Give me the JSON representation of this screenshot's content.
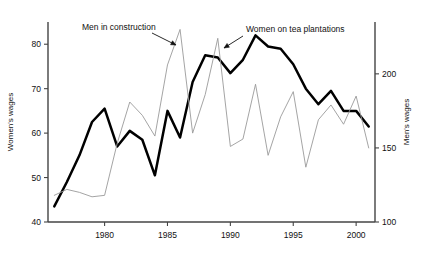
{
  "chart_data": {
    "type": "line",
    "title": "",
    "xlabel": "",
    "ylabel": "Women's wages",
    "y2label": "Men's wages",
    "xlim": [
      1975.5,
      2001.5
    ],
    "ylim": [
      40,
      85
    ],
    "y2lim": [
      100,
      235
    ],
    "grid": false,
    "legend": "none (inline annotations with arrows)",
    "x_ticks": [
      "1980",
      "1985",
      "1990",
      "1995",
      "2000"
    ],
    "x_tick_values": [
      1980,
      1985,
      1990,
      1995,
      2000
    ],
    "y_ticks": [
      "40",
      "50",
      "60",
      "70",
      "80"
    ],
    "y_tick_values": [
      40,
      50,
      60,
      70,
      80
    ],
    "y2_ticks": [
      "100",
      "150",
      "200"
    ],
    "y2_tick_values": [
      100,
      150,
      200
    ],
    "annotations": [
      {
        "text": "Men in construction",
        "points_to_series": "Men in construction",
        "points_to_year": 1986
      },
      {
        "text": "Women on tea plantations",
        "points_to_series": "Women on tea plantations",
        "points_to_year": 1992
      }
    ],
    "x": [
      1976,
      1977,
      1978,
      1979,
      1980,
      1981,
      1982,
      1983,
      1984,
      1985,
      1986,
      1987,
      1988,
      1989,
      1990,
      1991,
      1992,
      1993,
      1994,
      1995,
      1996,
      1997,
      1998,
      1999,
      2000,
      2001
    ],
    "series": [
      {
        "name": "Women on tea plantations",
        "axis": "left",
        "style": "thick black line",
        "color": "#000000",
        "values": [
          43.5,
          49.0,
          55.0,
          62.5,
          65.5,
          57.0,
          60.5,
          58.5,
          50.5,
          65.0,
          59.0,
          71.5,
          77.5,
          77.0,
          73.5,
          76.5,
          82.0,
          79.5,
          79.0,
          75.5,
          70.0,
          66.5,
          69.5,
          65.0,
          65.0,
          61.5
        ]
      },
      {
        "name": "Men in construction",
        "axis": "right",
        "style": "thin grey line",
        "color": "#9a9a9a",
        "values": [
          118,
          122,
          120,
          117,
          118,
          153,
          181,
          172,
          158,
          206,
          230,
          160,
          186,
          224,
          151,
          156,
          193,
          145,
          171,
          188,
          137,
          169,
          179,
          166,
          185,
          150
        ]
      }
    ]
  }
}
